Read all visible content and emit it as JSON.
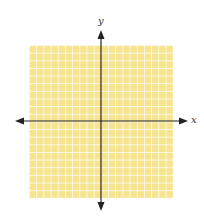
{
  "figure": {
    "type": "coordinate-plane",
    "grid": {
      "columns": 20,
      "rows": 20,
      "fill_color": "#f6e48e",
      "line_color": "#ffffff"
    },
    "axes": {
      "color": "#222222",
      "x_label": "x",
      "y_label": "y"
    }
  }
}
